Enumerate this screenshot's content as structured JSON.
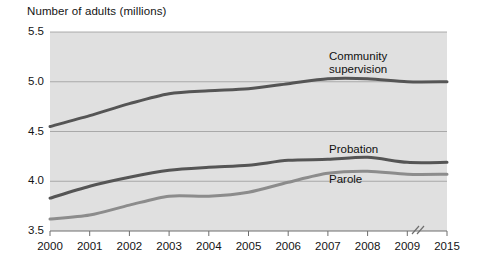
{
  "chart_data": {
    "type": "line",
    "title": "Number of adults (millions)",
    "xlabel": "",
    "ylabel": "Number of adults (millions)",
    "categories": [
      "2000",
      "2001",
      "2002",
      "2003",
      "2004",
      "2005",
      "2006",
      "2007",
      "2008",
      "2009",
      "2015"
    ],
    "x_tick_labels": [
      "2000",
      "2001",
      "2002",
      "2003",
      "2004",
      "2005",
      "2006",
      "2007",
      "2008",
      "2009",
      "2015"
    ],
    "y_tick_labels": [
      "5.5",
      "5.0",
      "4.5",
      "4.0",
      "3.5"
    ],
    "y_ticks": [
      5.5,
      5.0,
      4.5,
      4.0,
      3.5
    ],
    "ylim": [
      3.5,
      5.5
    ],
    "grid": true,
    "grid_axis": "y",
    "legend_position": "inline-labels",
    "axis_break": {
      "present": true,
      "symbol": "//",
      "between": [
        "2009",
        "2015"
      ]
    },
    "plot_background": "#e0e0e0",
    "series": [
      {
        "name": "Community supervision",
        "label": "Community\nsupervision",
        "label_line_1": "Community",
        "label_line_2": "supervision",
        "color": "#555555",
        "values": [
          4.55,
          4.66,
          4.78,
          4.88,
          4.91,
          4.93,
          4.98,
          5.03,
          5.03,
          5.0,
          5.0
        ]
      },
      {
        "name": "Probation",
        "label": "Probation",
        "color": "#555555",
        "values": [
          3.83,
          3.95,
          4.04,
          4.11,
          4.14,
          4.16,
          4.21,
          4.22,
          4.24,
          4.19,
          4.19
        ]
      },
      {
        "name": "Parole",
        "label": "Parole",
        "color": "#8c8c8c",
        "values": [
          3.62,
          3.66,
          3.76,
          3.85,
          3.85,
          3.89,
          3.99,
          4.08,
          4.1,
          4.07,
          4.07
        ]
      }
    ]
  }
}
